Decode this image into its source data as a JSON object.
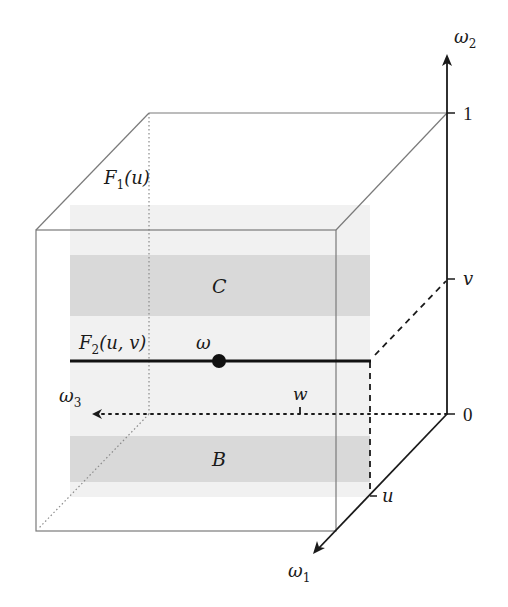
{
  "diagram": {
    "colors": {
      "background": "#ffffff",
      "cube_edge": "#7a7a7a",
      "axis": "#1a1a1a",
      "slab_fill": "#f0f0f0",
      "band_fill": "#d9d9d9",
      "highlight_line": "#111111"
    },
    "axes": {
      "omega2": {
        "base": "ω",
        "sub": "2"
      },
      "omega1": {
        "base": "ω",
        "sub": "1"
      },
      "omega3": {
        "base": "ω",
        "sub": "3"
      }
    },
    "ticks": {
      "one": "1",
      "zero": "0",
      "v": "v",
      "u": "u",
      "w": "w"
    },
    "labels": {
      "F1": {
        "base": "F",
        "sub": "1",
        "arg": "(u)"
      },
      "F2": {
        "base": "F",
        "sub": "2",
        "arg": "(u, v)"
      },
      "omega_point": "ω",
      "set_C": "C",
      "set_B": "B"
    }
  }
}
